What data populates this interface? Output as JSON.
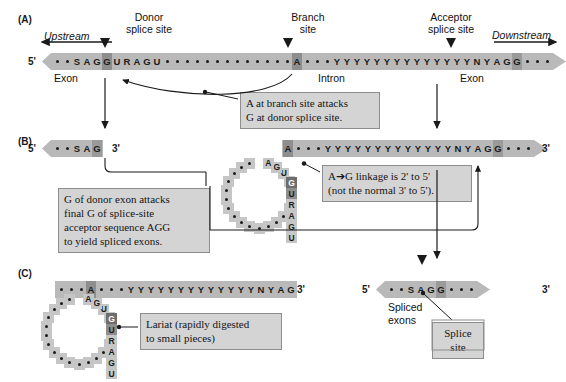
{
  "figure": {
    "panels": [
      "(A)",
      "(B)",
      "(C)"
    ]
  },
  "panelA": {
    "label": "(A)",
    "donor_label_l1": "Donor",
    "donor_label_l2": "splice site",
    "branch_label_l1": "Branch",
    "branch_label_l2": "site",
    "acceptor_label_l1": "Acceptor",
    "acceptor_label_l2": "splice site",
    "upstream": "Upstream",
    "downstream": "Downstream",
    "five_prime": "5'",
    "three_prime": "3'",
    "exon_left": "Exon",
    "exon_right": "Exon",
    "intron": "Intron",
    "sequence": [
      {
        "c": "•",
        "hl": "none"
      },
      {
        "c": "•",
        "hl": "none"
      },
      {
        "c": "S",
        "hl": "none"
      },
      {
        "c": "A",
        "hl": "none"
      },
      {
        "c": "G",
        "hl": "none"
      },
      {
        "c": "G",
        "hl": "dark"
      },
      {
        "c": "U",
        "hl": "none"
      },
      {
        "c": "R",
        "hl": "none"
      },
      {
        "c": "A",
        "hl": "none"
      },
      {
        "c": "G",
        "hl": "none"
      },
      {
        "c": "U",
        "hl": "none"
      },
      {
        "c": "•",
        "hl": "none"
      },
      {
        "c": "•",
        "hl": "none"
      },
      {
        "c": "•",
        "hl": "none"
      },
      {
        "c": "•",
        "hl": "none"
      },
      {
        "c": "•",
        "hl": "none"
      },
      {
        "c": "•",
        "hl": "none"
      },
      {
        "c": "•",
        "hl": "none"
      },
      {
        "c": "•",
        "hl": "none"
      },
      {
        "c": "•",
        "hl": "none"
      },
      {
        "c": "•",
        "hl": "none"
      },
      {
        "c": "•",
        "hl": "none"
      },
      {
        "c": "•",
        "hl": "none"
      },
      {
        "c": "•",
        "hl": "none"
      },
      {
        "c": "A",
        "hl": "dark"
      },
      {
        "c": "•",
        "hl": "none"
      },
      {
        "c": "•",
        "hl": "none"
      },
      {
        "c": "•",
        "hl": "none"
      },
      {
        "c": "Y",
        "hl": "none"
      },
      {
        "c": "Y",
        "hl": "none"
      },
      {
        "c": "Y",
        "hl": "none"
      },
      {
        "c": "Y",
        "hl": "none"
      },
      {
        "c": "Y",
        "hl": "none"
      },
      {
        "c": "Y",
        "hl": "none"
      },
      {
        "c": "Y",
        "hl": "none"
      },
      {
        "c": "Y",
        "hl": "none"
      },
      {
        "c": "Y",
        "hl": "none"
      },
      {
        "c": "Y",
        "hl": "none"
      },
      {
        "c": "Y",
        "hl": "none"
      },
      {
        "c": "Y",
        "hl": "none"
      },
      {
        "c": "Y",
        "hl": "none"
      },
      {
        "c": "Y",
        "hl": "none"
      },
      {
        "c": "N",
        "hl": "none"
      },
      {
        "c": "Y",
        "hl": "none"
      },
      {
        "c": "A",
        "hl": "none"
      },
      {
        "c": "G",
        "hl": "none"
      },
      {
        "c": "G",
        "hl": "mid"
      },
      {
        "c": "•",
        "hl": "none"
      },
      {
        "c": "•",
        "hl": "none"
      },
      {
        "c": "•",
        "hl": "none"
      }
    ]
  },
  "panelB": {
    "label": "(B)",
    "five_prime": "5'",
    "three_prime": "3'",
    "left_exon": [
      {
        "c": "•",
        "hl": "none"
      },
      {
        "c": "•",
        "hl": "none"
      },
      {
        "c": "S",
        "hl": "none"
      },
      {
        "c": "A",
        "hl": "none"
      },
      {
        "c": "G",
        "hl": "mid"
      }
    ],
    "intron_tail": [
      {
        "c": "A",
        "hl": "dark"
      },
      {
        "c": "•",
        "hl": "none"
      },
      {
        "c": "•",
        "hl": "none"
      },
      {
        "c": "•",
        "hl": "none"
      },
      {
        "c": "Y",
        "hl": "none"
      },
      {
        "c": "Y",
        "hl": "none"
      },
      {
        "c": "Y",
        "hl": "none"
      },
      {
        "c": "Y",
        "hl": "none"
      },
      {
        "c": "Y",
        "hl": "none"
      },
      {
        "c": "Y",
        "hl": "none"
      },
      {
        "c": "Y",
        "hl": "none"
      },
      {
        "c": "Y",
        "hl": "none"
      },
      {
        "c": "Y",
        "hl": "none"
      },
      {
        "c": "Y",
        "hl": "none"
      },
      {
        "c": "Y",
        "hl": "none"
      },
      {
        "c": "Y",
        "hl": "none"
      },
      {
        "c": "Y",
        "hl": "none"
      },
      {
        "c": "N",
        "hl": "none"
      },
      {
        "c": "Y",
        "hl": "none"
      },
      {
        "c": "A",
        "hl": "none"
      },
      {
        "c": "G",
        "hl": "none"
      },
      {
        "c": "G",
        "hl": "mid"
      },
      {
        "c": "•",
        "hl": "none"
      },
      {
        "c": "•",
        "hl": "none"
      },
      {
        "c": "•",
        "hl": "none"
      }
    ],
    "lariat_ring": [
      "•",
      "•",
      "•",
      "•",
      "•",
      "•",
      "•",
      "•",
      "•",
      "•",
      "•",
      "•",
      "•",
      "•",
      "U",
      "G",
      "A",
      "R",
      "U",
      "G",
      "A"
    ],
    "lariat_branch_letters": [
      "A",
      "G",
      "U",
      "R",
      "A",
      "G",
      "U"
    ]
  },
  "panelC": {
    "label": "(C)",
    "three_prime": "3'",
    "five_prime": "5'",
    "lariat_tail": [
      {
        "c": "•",
        "hl": "none"
      },
      {
        "c": "•",
        "hl": "none"
      },
      {
        "c": "•",
        "hl": "none"
      },
      {
        "c": "A",
        "hl": "dark"
      },
      {
        "c": "•",
        "hl": "none"
      },
      {
        "c": "•",
        "hl": "none"
      },
      {
        "c": "•",
        "hl": "none"
      },
      {
        "c": "Y",
        "hl": "none"
      },
      {
        "c": "Y",
        "hl": "none"
      },
      {
        "c": "Y",
        "hl": "none"
      },
      {
        "c": "Y",
        "hl": "none"
      },
      {
        "c": "Y",
        "hl": "none"
      },
      {
        "c": "Y",
        "hl": "none"
      },
      {
        "c": "Y",
        "hl": "none"
      },
      {
        "c": "Y",
        "hl": "none"
      },
      {
        "c": "Y",
        "hl": "none"
      },
      {
        "c": "Y",
        "hl": "none"
      },
      {
        "c": "Y",
        "hl": "none"
      },
      {
        "c": "Y",
        "hl": "none"
      },
      {
        "c": "Y",
        "hl": "none"
      },
      {
        "c": "N",
        "hl": "none"
      },
      {
        "c": "Y",
        "hl": "none"
      },
      {
        "c": "A",
        "hl": "none"
      },
      {
        "c": "G",
        "hl": "none"
      }
    ],
    "spliced": [
      {
        "c": "•",
        "hl": "none"
      },
      {
        "c": "•",
        "hl": "none"
      },
      {
        "c": "S",
        "hl": "none"
      },
      {
        "c": "A",
        "hl": "none"
      },
      {
        "c": "G",
        "hl": "none"
      },
      {
        "c": "G",
        "hl": "mid"
      },
      {
        "c": "•",
        "hl": "none"
      },
      {
        "c": "•",
        "hl": "none"
      },
      {
        "c": "•",
        "hl": "none"
      }
    ],
    "spliced_exons_l1": "Spliced",
    "spliced_exons_l2": "exons",
    "splice_site_l1": "Splice",
    "splice_site_l2": "site"
  },
  "notes": {
    "branch_attack": "A at branch site attacks\nG at donor splice site.",
    "linkage": "A➔G linkage is 2' to 5'\n(not the normal 3' to 5').",
    "donor_attack": "G of donor exon attacks\nfinal G of splice-site\nacceptor sequence AGG\nto yield spliced exons.",
    "lariat": "Lariat (rapidly digested\nto small pieces)"
  },
  "colors": {
    "strand": "#b9b9b9",
    "highlight_dark": "#6d6d6d",
    "highlight_mid": "#8e8e8e",
    "ring": "#c6c6c6",
    "note_bg": "#d4d4d4",
    "note_border": "#8d8d8d",
    "ink": "#1a1a1a"
  }
}
